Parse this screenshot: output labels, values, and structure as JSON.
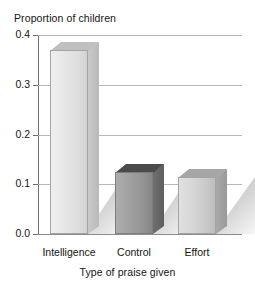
{
  "chart_data": {
    "type": "bar",
    "title": "",
    "subtitle": "",
    "ylabel": "Proportion of children",
    "xlabel": "Type of praise given",
    "categories": [
      "Intelligence",
      "Control",
      "Effort"
    ],
    "values": [
      0.37,
      0.125,
      0.115
    ],
    "series": [
      {
        "name": "Proportion of children",
        "values": [
          0.37,
          0.125,
          0.115
        ]
      }
    ],
    "ylim": [
      0.0,
      0.4
    ],
    "xlim": null,
    "ytick_labels": [
      "0.4",
      "0.3",
      "0.2",
      "0.1",
      "0.0"
    ],
    "ytick_values": [
      0.4,
      0.3,
      0.2,
      0.1,
      0.0
    ],
    "grid": true,
    "grid_axis": "y",
    "legend": false,
    "legend_position": "none",
    "annotations": [],
    "style": "3d-bar-with-drop-shadow",
    "bar_colors": [
      "#e3e3e3",
      "#9a9a9a",
      "#d0d0d0"
    ],
    "bar_color_names": [
      "light-gray",
      "dark-gray",
      "medium-light-gray"
    ]
  },
  "colors": {
    "background": "#ffffff",
    "text": "#141414",
    "gridline": "#b7b7b7",
    "axis_line": "#6f6f6f",
    "baseline": "#8c8c8c",
    "bar_light": "#e3e3e3",
    "bar_dark": "#9a9a9a",
    "bar_medium": "#d0d0d0",
    "shadow": "#a8a8a8"
  }
}
